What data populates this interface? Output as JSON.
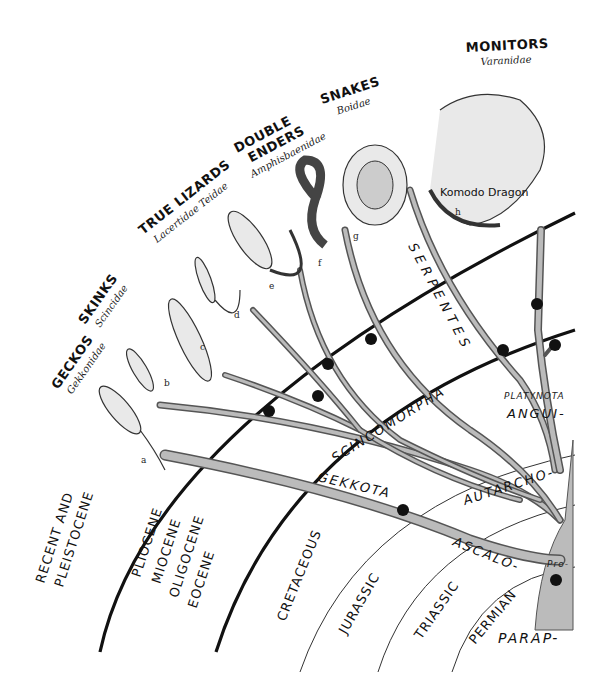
{
  "groups": [
    {
      "id": "a",
      "name": "GECKOS",
      "family": "Gekkonidae"
    },
    {
      "id": "b",
      "name": "SKINKS",
      "family": "Scincidae"
    },
    {
      "id": "c_d",
      "name": "TRUE LIZARDS",
      "family": "Lacertidae  Teidae"
    },
    {
      "id": "e_f",
      "name_line1": "DOUBLE",
      "name_line2": "ENDERS",
      "family": "Amphisbaenidae"
    },
    {
      "id": "g",
      "name": "SNAKES",
      "family": "Boidae"
    },
    {
      "id": "h",
      "name": "MONITORS",
      "family": "Varanidae"
    }
  ],
  "animal_letters": [
    "a",
    "b",
    "c",
    "d",
    "e",
    "f",
    "g",
    "h"
  ],
  "animal_caption": "Komodo Dragon",
  "eras": [
    {
      "line1": "RECENT AND",
      "line2": "PLEISTOCENE"
    },
    {
      "line1": "PLIOCENE",
      "line2": "MIOCENE",
      "line3": "OLIGOCENE",
      "line4": "EOCENE"
    },
    {
      "line1": "CRETACEOUS"
    },
    {
      "line1": "JURASSIC"
    },
    {
      "line1": "TRIASSIC"
    },
    {
      "line1": "PERMIAN"
    }
  ],
  "clades": {
    "serpentes": "SERPENTES",
    "scincomorpha": "SCINCOMORPHA",
    "gekkota": "GEKKOTA",
    "autarcho": "AUTARCHO-",
    "platynota": "PLATYNOTA",
    "angui": "ANGUI-",
    "ascalo": "ASCALO-",
    "pro": "Pro-",
    "parap": "PARAP-"
  },
  "colors": {
    "ink": "#111111",
    "branch_fill": "#bbbbbb",
    "branch_edge": "#555555",
    "paper": "#ffffff"
  }
}
